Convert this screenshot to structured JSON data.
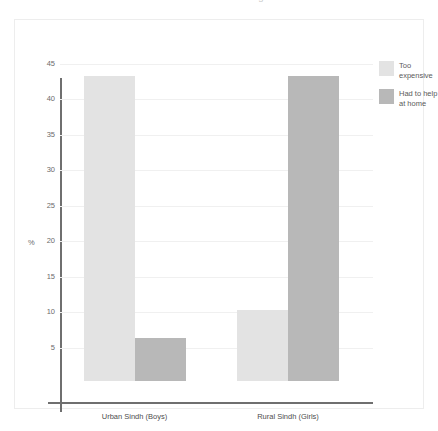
{
  "title_sliver": "Reasons for never attending school",
  "chart_data": {
    "type": "bar",
    "title": "",
    "xlabel": "",
    "ylabel": "%",
    "ylim": [
      0,
      45
    ],
    "yticks": [
      5,
      10,
      15,
      20,
      25,
      30,
      35,
      40,
      45
    ],
    "grid": true,
    "legend_position": "right",
    "categories": [
      "Urban Sindh (Boys)",
      "Rural Sindh (Girls)"
    ],
    "series": [
      {
        "name": "Too expensive",
        "color": "#e3e3e3",
        "values": [
          43,
          10
        ]
      },
      {
        "name": "Had to help at home",
        "color": "#b8b8b8",
        "values": [
          6,
          43
        ]
      }
    ]
  },
  "axis": {
    "y_title": "%"
  }
}
